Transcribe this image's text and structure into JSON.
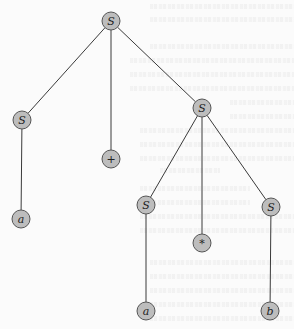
{
  "diagram": {
    "type": "parse-tree",
    "colors": {
      "node_fill": "#bdbdbd",
      "node_stroke": "#555555",
      "edge": "#3a3a3a",
      "label": "#222222",
      "background": "#fbfbfb"
    },
    "nodes": [
      {
        "id": "n0",
        "label": "S",
        "x": 111,
        "y": 21
      },
      {
        "id": "n1",
        "label": "S",
        "x": 22,
        "y": 120
      },
      {
        "id": "n2",
        "label": "+",
        "x": 111,
        "y": 159
      },
      {
        "id": "n3",
        "label": "S",
        "x": 202,
        "y": 108
      },
      {
        "id": "n4",
        "label": "a",
        "x": 21,
        "y": 219
      },
      {
        "id": "n5",
        "label": "S",
        "x": 146,
        "y": 205
      },
      {
        "id": "n6",
        "label": "*",
        "x": 202,
        "y": 243
      },
      {
        "id": "n7",
        "label": "S",
        "x": 271,
        "y": 207
      },
      {
        "id": "n8",
        "label": "a",
        "x": 146,
        "y": 311
      },
      {
        "id": "n9",
        "label": "b",
        "x": 270,
        "y": 311
      }
    ],
    "edges": [
      [
        "n0",
        "n1"
      ],
      [
        "n0",
        "n2"
      ],
      [
        "n0",
        "n3"
      ],
      [
        "n1",
        "n4"
      ],
      [
        "n3",
        "n5"
      ],
      [
        "n3",
        "n6"
      ],
      [
        "n3",
        "n7"
      ],
      [
        "n5",
        "n8"
      ],
      [
        "n7",
        "n9"
      ]
    ]
  }
}
